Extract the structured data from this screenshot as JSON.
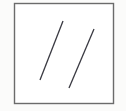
{
  "figure": {
    "title": "Two parallel diagonal line segments inside a square frame",
    "canvas": {
      "width": 126,
      "height": 111,
      "background_color": "#fbfbfa"
    },
    "frame": {
      "name": "square-border",
      "x": 14.5,
      "y": 3.5,
      "width": 99,
      "height": 100,
      "stroke_color": "#6b6b6b",
      "stroke_width": 1.4,
      "fill_color": "#ffffff"
    },
    "segments": [
      {
        "label": "left-segment",
        "x1": 63,
        "y1": 21,
        "x2": 40,
        "y2": 80,
        "stroke_color": "#3a3a42",
        "stroke_width": 1.3
      },
      {
        "label": "right-segment",
        "x1": 94,
        "y1": 29,
        "x2": 69,
        "y2": 88,
        "stroke_color": "#3a3a42",
        "stroke_width": 1.3
      }
    ]
  },
  "chart_data": {
    "type": "line",
    "title": "Two parallel diagonal line segments inside a square frame",
    "xlabel": "",
    "ylabel": "",
    "xlim": [
      14.5,
      113.5
    ],
    "ylim": [
      3.5,
      103.5
    ],
    "grid": false,
    "legend": "none",
    "series": [
      {
        "name": "left-segment",
        "x": [
          63,
          40
        ],
        "y": [
          21,
          80
        ],
        "color": "#3a3a42"
      },
      {
        "name": "right-segment",
        "x": [
          94,
          69
        ],
        "y": [
          29,
          88
        ],
        "color": "#3a3a42"
      }
    ],
    "annotations": []
  }
}
